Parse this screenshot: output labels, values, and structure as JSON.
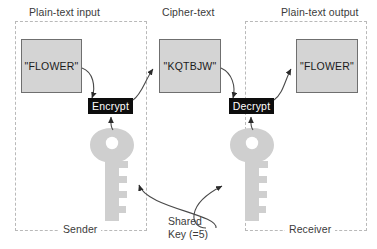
{
  "diagram": {
    "panels": [
      {
        "id": "sender",
        "title": "Plain-text input",
        "footer": "Sender"
      },
      {
        "id": "cipher",
        "title": "Cipher-text",
        "footer": ""
      },
      {
        "id": "receiver",
        "title": "Plain-text output",
        "footer": "Receiver"
      }
    ],
    "nodes": {
      "plaintext_input": "\"FLOWER\"",
      "ciphertext": "\"KQTBJW\"",
      "plaintext_output": "\"FLOWER\"",
      "encrypt": "Encrypt",
      "decrypt": "Decrypt"
    },
    "key_label": {
      "line1": "Shared",
      "line2": "Key (=5)"
    },
    "icons": {
      "sender_key": "key-icon",
      "receiver_key": "key-icon"
    },
    "colors": {
      "box_fill": "#d4d4d4",
      "box_border": "#6f6f6f",
      "op_fill": "#0d0d0d",
      "op_text": "#ffffff",
      "panel_border": "#b9b9b9",
      "key_fill": "#cfcfcf",
      "connector": "#4a4a4a",
      "text": "#3b3b3b",
      "background": "#ffffff"
    }
  }
}
